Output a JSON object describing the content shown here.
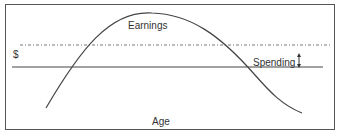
{
  "diagram": {
    "title": "",
    "labels": {
      "earnings": "Earnings",
      "dollar": "$",
      "spending": "Spending",
      "age": "Age"
    },
    "elements": {
      "earnings_curve": "inverted-U curve of earnings over age",
      "dotted_line": "dash-dot horizontal reference line",
      "spending_line": "solid horizontal spending level line",
      "gap_arrow": "double-headed vertical arrow between dotted line and spending line"
    },
    "colors": {
      "frame": "#555555",
      "curve": "#444444",
      "dotted_line": "#777777",
      "spending_line": "#444444",
      "text": "#333333"
    }
  }
}
